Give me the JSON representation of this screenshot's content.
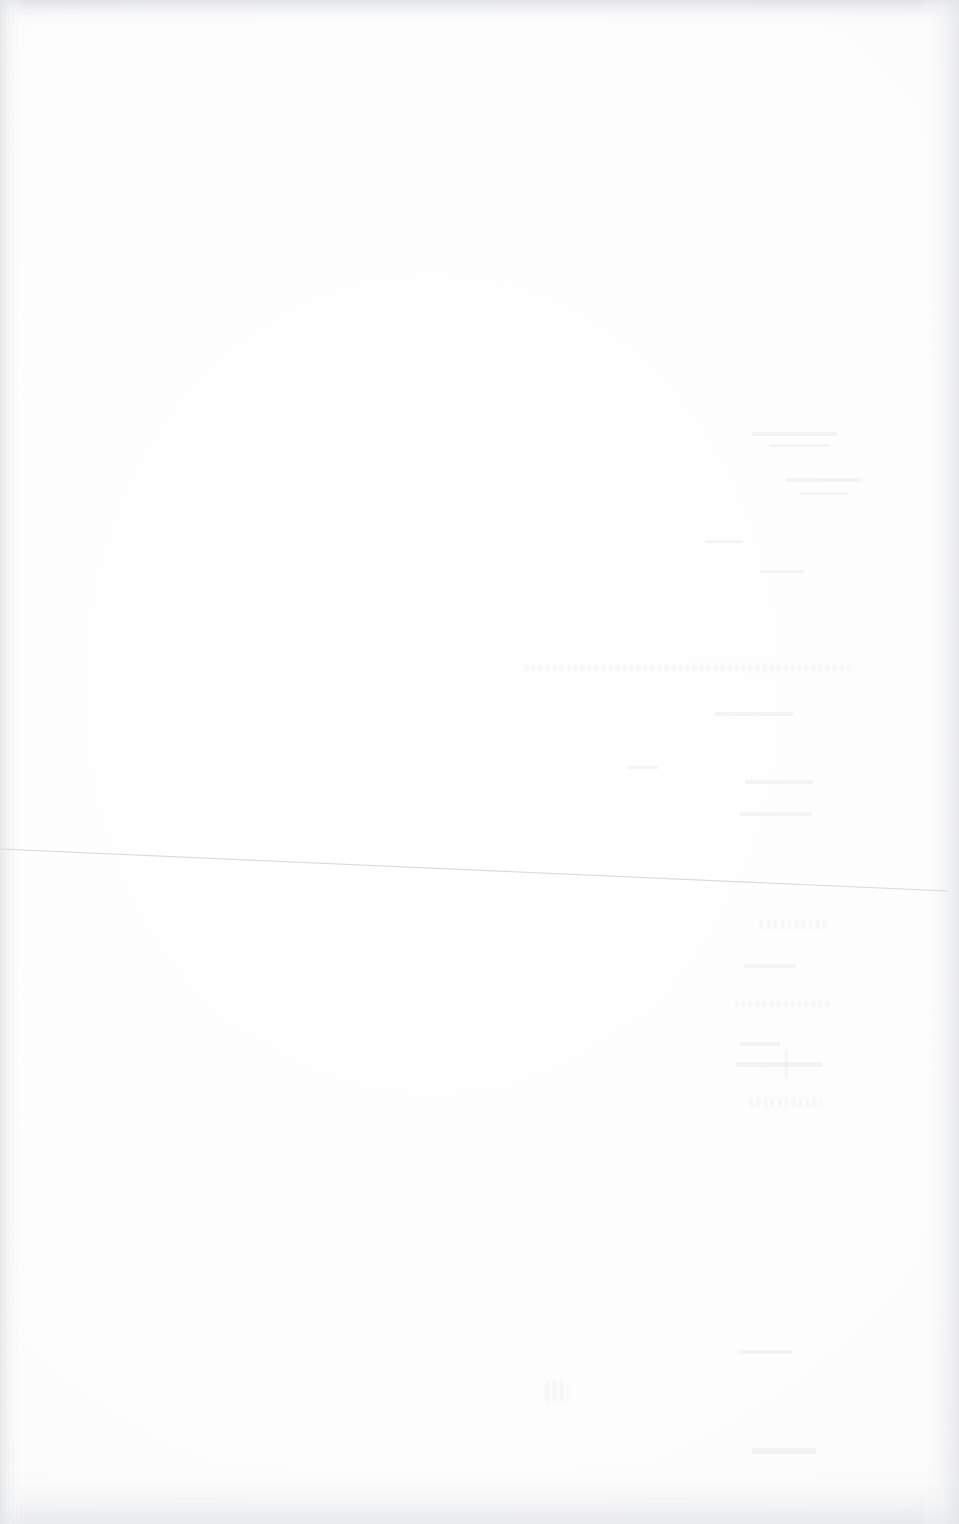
{
  "document": {
    "kind": "scanned-page",
    "orientation": "portrait",
    "width_px": 959,
    "height_px": 1524,
    "visible_text": "",
    "note": "Blank scanned sheet — no legible printed or handwritten text is rendered."
  },
  "colors": {
    "paper": "#fefefe",
    "edge_shadow": "#e4e5e8",
    "rule_line": "#d8dadd",
    "ghost_trace": "#ced0d6"
  },
  "rule_line": {
    "name": "faint-horizontal-rule",
    "x1": 0,
    "y1": 849,
    "x2": 948,
    "y2": 891,
    "stroke": "#d8dadd",
    "stroke_width": 1.1
  },
  "edges": {
    "top_label": "top-scan-edge",
    "bottom_label": "bottom-scan-edge",
    "left_label": "left-scan-edge",
    "right_label": "right-scan-edge"
  },
  "ghost_traces": [
    {
      "x": 752,
      "y": 432,
      "w": 86,
      "h": 4,
      "label": "ghost-trace-1"
    },
    {
      "x": 769,
      "y": 444,
      "w": 60,
      "h": 3,
      "label": "ghost-trace-2"
    },
    {
      "x": 786,
      "y": 478,
      "w": 74,
      "h": 4,
      "label": "ghost-trace-3"
    },
    {
      "x": 800,
      "y": 492,
      "w": 48,
      "h": 3,
      "label": "ghost-trace-4"
    },
    {
      "x": 705,
      "y": 540,
      "w": 38,
      "h": 3,
      "label": "ghost-trace-5"
    },
    {
      "x": 760,
      "y": 570,
      "w": 44,
      "h": 3,
      "label": "ghost-trace-6"
    },
    {
      "x": 525,
      "y": 664,
      "w": 330,
      "h": 7,
      "label": "ghost-text-line-1"
    },
    {
      "x": 715,
      "y": 712,
      "w": 78,
      "h": 4,
      "label": "ghost-trace-7"
    },
    {
      "x": 628,
      "y": 766,
      "w": 30,
      "h": 3,
      "label": "ghost-trace-8"
    },
    {
      "x": 745,
      "y": 780,
      "w": 68,
      "h": 4,
      "label": "ghost-trace-9"
    },
    {
      "x": 740,
      "y": 812,
      "w": 72,
      "h": 4,
      "label": "ghost-trace-10"
    },
    {
      "x": 760,
      "y": 920,
      "w": 66,
      "h": 9,
      "label": "ghost-trace-11"
    },
    {
      "x": 744,
      "y": 964,
      "w": 52,
      "h": 4,
      "label": "ghost-trace-12"
    },
    {
      "x": 735,
      "y": 1000,
      "w": 96,
      "h": 7,
      "label": "ghost-trace-13"
    },
    {
      "x": 740,
      "y": 1042,
      "w": 40,
      "h": 4,
      "label": "ghost-trace-14"
    },
    {
      "x": 736,
      "y": 1062,
      "w": 86,
      "h": 5,
      "label": "ghost-trace-15"
    },
    {
      "x": 785,
      "y": 1050,
      "w": 4,
      "h": 28,
      "label": "ghost-trace-16"
    },
    {
      "x": 750,
      "y": 1098,
      "w": 72,
      "h": 9,
      "label": "ghost-trace-17"
    },
    {
      "x": 546,
      "y": 1380,
      "w": 22,
      "h": 22,
      "label": "ghost-trace-18"
    },
    {
      "x": 740,
      "y": 1350,
      "w": 52,
      "h": 4,
      "label": "ghost-trace-19"
    },
    {
      "x": 752,
      "y": 1448,
      "w": 64,
      "h": 6,
      "label": "ghost-trace-20"
    }
  ]
}
